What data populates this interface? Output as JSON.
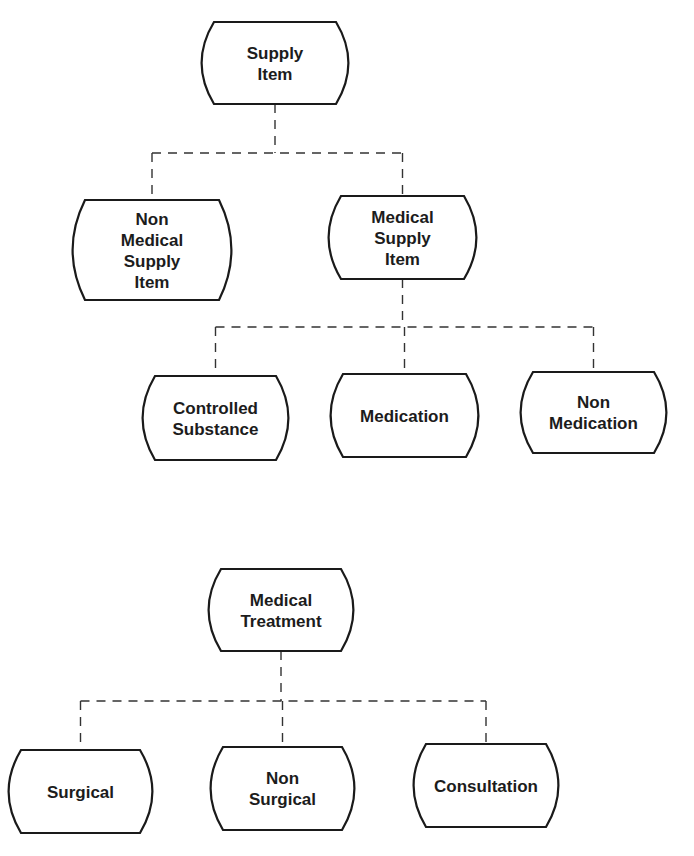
{
  "diagrams": [
    {
      "name": "supply-item-hierarchy",
      "nodes": [
        {
          "id": "supply-item",
          "label": [
            "Supply",
            "Item"
          ]
        },
        {
          "id": "non-medical-supply-item",
          "label": [
            "Non",
            "Medical",
            "Supply",
            "Item"
          ],
          "parent": "supply-item"
        },
        {
          "id": "medical-supply-item",
          "label": [
            "Medical",
            "Supply",
            "Item"
          ],
          "parent": "supply-item"
        },
        {
          "id": "controlled-substance",
          "label": [
            "Controlled",
            "Substance"
          ],
          "parent": "medical-supply-item"
        },
        {
          "id": "medication",
          "label": [
            "Medication"
          ],
          "parent": "medical-supply-item"
        },
        {
          "id": "non-medication",
          "label": [
            "Non",
            "Medication"
          ],
          "parent": "medical-supply-item"
        }
      ]
    },
    {
      "name": "medical-treatment-hierarchy",
      "nodes": [
        {
          "id": "medical-treatment",
          "label": [
            "Medical",
            "Treatment"
          ]
        },
        {
          "id": "surgical",
          "label": [
            "Surgical"
          ],
          "parent": "medical-treatment"
        },
        {
          "id": "non-surgical",
          "label": [
            "Non",
            "Surgical"
          ],
          "parent": "medical-treatment"
        },
        {
          "id": "consultation",
          "label": [
            "Consultation"
          ],
          "parent": "medical-treatment"
        }
      ]
    }
  ],
  "colors": {
    "stroke": "#1a1a1a",
    "connector": "#333333",
    "background": "#ffffff",
    "text": "#1c1c1c"
  }
}
